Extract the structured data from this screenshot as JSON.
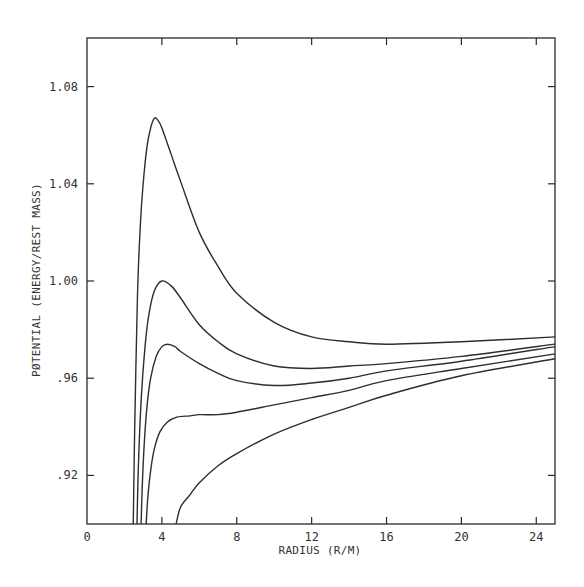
{
  "chart_data": {
    "type": "line",
    "title": "",
    "xlabel": "RADIUS (R/M)",
    "ylabel": "PØTENTIAL (ENERGY/REST MASS)",
    "xlim": [
      0,
      25
    ],
    "ylim": [
      0.9,
      1.1
    ],
    "grid": false,
    "legend": null,
    "x_ticks": [
      0,
      4,
      8,
      12,
      16,
      20,
      24
    ],
    "x_tick_labels": [
      "0",
      "4",
      "8",
      "12",
      "16",
      "20",
      "24"
    ],
    "y_ticks": [
      0.92,
      0.96,
      1.0,
      1.04,
      1.08
    ],
    "y_tick_labels": [
      ".92",
      ".96",
      "1.00",
      "1.04",
      "1.08"
    ],
    "series": [
      {
        "name": "curve-1 (highest barrier, peak ≈1.067 at r≈3.6)",
        "x": [
          2.47,
          2.55,
          2.7,
          2.85,
          3.0,
          3.2,
          3.4,
          3.6,
          3.8,
          4.0,
          4.5,
          5.0,
          6.0,
          7.0,
          8.0,
          10.0,
          12.0,
          14.0,
          16.0,
          20.0,
          25.0
        ],
        "y": [
          0.9,
          0.94,
          0.995,
          1.023,
          1.04,
          1.055,
          1.063,
          1.067,
          1.066,
          1.063,
          1.052,
          1.041,
          1.02,
          1.006,
          0.995,
          0.983,
          0.977,
          0.975,
          0.974,
          0.975,
          0.977
        ]
      },
      {
        "name": "curve-2 (peak ≈1.00 at r≈4)",
        "x": [
          2.67,
          2.75,
          2.9,
          3.1,
          3.3,
          3.6,
          4.0,
          4.5,
          5.0,
          6.0,
          7.0,
          8.0,
          10.0,
          12.0,
          14.0,
          16.0,
          20.0,
          25.0
        ],
        "y": [
          0.9,
          0.925,
          0.952,
          0.973,
          0.986,
          0.996,
          1.0,
          0.998,
          0.993,
          0.982,
          0.975,
          0.97,
          0.965,
          0.964,
          0.965,
          0.966,
          0.969,
          0.974
        ]
      },
      {
        "name": "curve-3 (peak ≈0.974 at r≈4.3)",
        "x": [
          2.89,
          2.95,
          3.05,
          3.2,
          3.4,
          3.7,
          4.0,
          4.3,
          4.7,
          5.0,
          6.0,
          7.0,
          8.0,
          10.0,
          12.0,
          14.0,
          16.0,
          20.0,
          25.0
        ],
        "y": [
          0.9,
          0.915,
          0.932,
          0.948,
          0.96,
          0.969,
          0.973,
          0.974,
          0.973,
          0.971,
          0.966,
          0.962,
          0.959,
          0.957,
          0.958,
          0.96,
          0.963,
          0.967,
          0.973
        ]
      },
      {
        "name": "curve-4 (inflection plateau ≈0.944 near r≈6)",
        "x": [
          3.16,
          3.25,
          3.4,
          3.6,
          3.9,
          4.3,
          4.8,
          5.5,
          6.0,
          7.0,
          8.0,
          10.0,
          12.0,
          14.0,
          16.0,
          20.0,
          25.0
        ],
        "y": [
          0.9,
          0.911,
          0.922,
          0.931,
          0.938,
          0.942,
          0.944,
          0.9445,
          0.945,
          0.945,
          0.946,
          0.949,
          0.952,
          0.955,
          0.959,
          0.964,
          0.97
        ]
      },
      {
        "name": "curve-5 (no barrier, monotonic)",
        "x": [
          4.76,
          5.0,
          5.5,
          6.0,
          7.0,
          8.0,
          10.0,
          12.0,
          14.0,
          16.0,
          20.0,
          25.0
        ],
        "y": [
          0.9,
          0.907,
          0.912,
          0.917,
          0.924,
          0.929,
          0.937,
          0.943,
          0.948,
          0.953,
          0.961,
          0.968
        ]
      }
    ]
  },
  "axes": {
    "x_title": "RADIUS (R/M)",
    "y_title": "PØTENTIAL (ENERGY/REST MASS)"
  }
}
